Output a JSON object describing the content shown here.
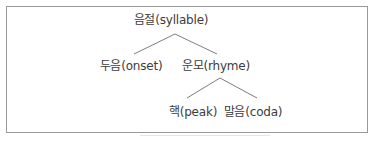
{
  "diagram": {
    "type": "tree",
    "nodes": {
      "root": {
        "label": "음절(syllable)",
        "x": 171,
        "y": 13
      },
      "onset": {
        "label": "두음(onset)",
        "x": 131,
        "y": 59
      },
      "rhyme": {
        "label": "운모(rhyme)",
        "x": 216,
        "y": 59
      },
      "peak": {
        "label": "핵(peak)",
        "x": 193,
        "y": 105
      },
      "coda": {
        "label": "말음(coda)",
        "x": 253,
        "y": 105
      }
    },
    "edges": [
      {
        "from": "root",
        "to": "onset"
      },
      {
        "from": "root",
        "to": "rhyme"
      },
      {
        "from": "rhyme",
        "to": "peak"
      },
      {
        "from": "rhyme",
        "to": "coda"
      }
    ],
    "colors": {
      "line": "#6e6e6e",
      "border": "#9a9a9a",
      "text": "#3c3c3c"
    }
  }
}
